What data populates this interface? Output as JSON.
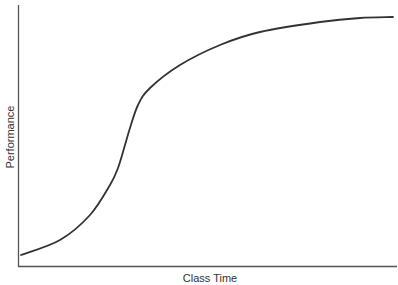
{
  "chart_data": {
    "type": "line",
    "title": "",
    "xlabel": "Class Time",
    "ylabel": "Performance",
    "grid": false,
    "legend": null,
    "ticks": {
      "x": [],
      "y": []
    },
    "series": [
      {
        "name": "Performance curve (S-curve)",
        "color": "#333333",
        "points_px": [
          [
            21,
            255
          ],
          [
            60,
            240
          ],
          [
            90,
            215
          ],
          [
            110,
            185
          ],
          [
            118,
            168
          ],
          [
            125,
            145
          ],
          [
            130,
            128
          ],
          [
            138,
            105
          ],
          [
            150,
            88
          ],
          [
            180,
            65
          ],
          [
            220,
            45
          ],
          [
            260,
            32
          ],
          [
            320,
            22
          ],
          [
            360,
            18
          ],
          [
            393,
            17
          ]
        ],
        "normalized": {
          "x": [
            0.0,
            0.1,
            0.18,
            0.24,
            0.26,
            0.28,
            0.29,
            0.32,
            0.35,
            0.43,
            0.53,
            0.64,
            0.8,
            0.91,
            1.0
          ],
          "y": [
            0.05,
            0.11,
            0.21,
            0.33,
            0.4,
            0.49,
            0.56,
            0.65,
            0.72,
            0.81,
            0.89,
            0.94,
            0.98,
            0.99,
            1.0
          ]
        }
      }
    ]
  },
  "colors": {
    "axis": "#555555",
    "line": "#333333",
    "background": "#ffffff"
  }
}
